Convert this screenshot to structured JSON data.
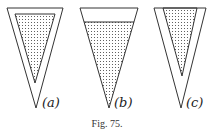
{
  "figure": {
    "caption": "Fig. 75.",
    "panels": [
      {
        "id": "a",
        "label": "(a)",
        "description": "thick-walled cone, inner cone filled to top with dotted contents"
      },
      {
        "id": "b",
        "label": "(b)",
        "description": "thin-walled cone, contents filled up to a level below the rim"
      },
      {
        "id": "c",
        "label": "(c)",
        "description": "thick-walled cone, narrower inner cone filled with dotted contents"
      }
    ],
    "colors": {
      "stroke": "#333333",
      "stipple": "#444444",
      "background": "#ffffff"
    }
  }
}
